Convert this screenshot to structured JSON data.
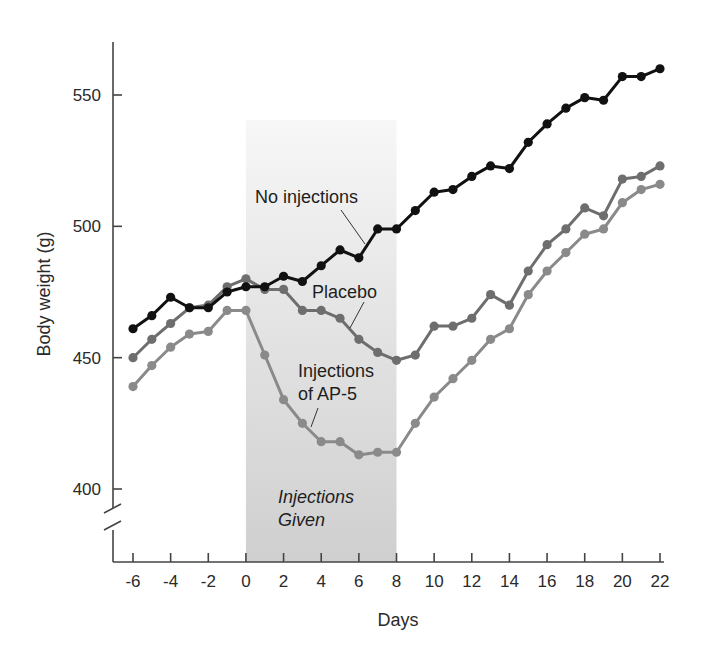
{
  "chart_data": {
    "type": "line",
    "title": "",
    "xlabel": "Days",
    "ylabel": "Body weight (g)",
    "xlim": [
      -6,
      22
    ],
    "ylim": [
      400,
      570
    ],
    "y_axis_break": true,
    "grid": false,
    "legend": "inline-annotations",
    "x_ticks": [
      -6,
      -4,
      -2,
      0,
      2,
      4,
      6,
      8,
      10,
      12,
      14,
      16,
      18,
      20,
      22
    ],
    "x_tick_labels": [
      "-6",
      "-4",
      "-2",
      "0",
      "2",
      "4",
      "6",
      "8",
      "10",
      "12",
      "14",
      "16",
      "18",
      "20",
      "22"
    ],
    "y_ticks": [
      400,
      450,
      500,
      550
    ],
    "y_tick_labels": [
      "400",
      "450",
      "500",
      "550"
    ],
    "x": [
      -6,
      -5,
      -4,
      -3,
      -2,
      -1,
      0,
      1,
      2,
      3,
      4,
      5,
      6,
      7,
      8,
      9,
      10,
      11,
      12,
      13,
      14,
      15,
      16,
      17,
      18,
      19,
      20,
      21,
      22
    ],
    "series": [
      {
        "name": "No injections",
        "color": "#111111",
        "values": [
          461,
          466,
          473,
          469,
          469,
          475,
          477,
          477,
          481,
          479,
          485,
          491,
          488,
          499,
          499,
          506,
          513,
          514,
          519,
          523,
          522,
          532,
          539,
          545,
          549,
          548,
          557,
          557,
          560
        ]
      },
      {
        "name": "Placebo",
        "color": "#6e6e6e",
        "values": [
          450,
          457,
          463,
          469,
          470,
          477,
          480,
          476,
          476,
          468,
          468,
          465,
          457,
          452,
          449,
          451,
          462,
          462,
          465,
          474,
          470,
          483,
          493,
          499,
          507,
          504,
          518,
          519,
          523
        ]
      },
      {
        "name": "Injections of AP-5",
        "color": "#8a8a8a",
        "values": [
          439,
          447,
          454,
          459,
          460,
          468,
          468,
          451,
          434,
          425,
          418,
          418,
          413,
          414,
          414,
          425,
          435,
          442,
          449,
          457,
          461,
          474,
          483,
          490,
          497,
          499,
          509,
          514,
          516
        ]
      }
    ],
    "shaded_region": {
      "x_start": 0,
      "x_end": 8,
      "label": "Injections Given"
    },
    "annotations": [
      {
        "text": "No injections",
        "series": "No injections"
      },
      {
        "text": "Placebo",
        "series": "Placebo"
      },
      {
        "text": "Injections of AP-5",
        "series": "Injections of AP-5"
      },
      {
        "text": "Injections Given",
        "region": "shaded"
      }
    ]
  },
  "labels": {
    "ylabel": "Body weight (g)",
    "xlabel": "Days",
    "annot_no_injections": "No injections",
    "annot_placebo": "Placebo",
    "annot_ap5_line1": "Injections",
    "annot_ap5_line2": "of AP-5",
    "shaded_line1": "Injections",
    "shaded_line2": "Given"
  }
}
